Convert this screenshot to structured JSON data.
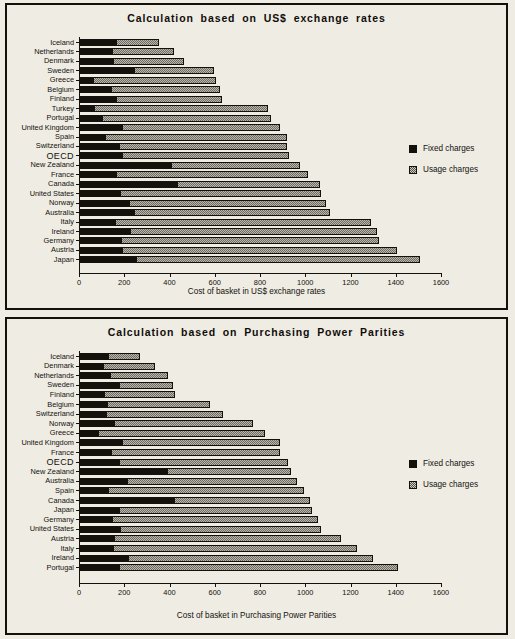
{
  "charts": [
    {
      "id": "usd",
      "title": "Calculation  based  on  US$  exchange  rates",
      "xlabel": "Cost of basket in US$ exchange rates",
      "legend": [
        {
          "key": "fixed",
          "label": "Fixed charges"
        },
        {
          "key": "usage",
          "label": "Usage charges"
        }
      ],
      "xticks": [
        "0",
        "200",
        "400",
        "600",
        "800",
        "1000",
        "1200",
        "1400",
        "1600"
      ],
      "chart_data": {
        "type": "bar",
        "orientation": "horizontal",
        "stacked": true,
        "title": "Calculation based on US$ exchange rates",
        "xlabel": "Cost of basket in US$ exchange rates",
        "ylabel": "",
        "xlim": [
          0,
          1600
        ],
        "xticks": [
          0,
          200,
          400,
          600,
          800,
          1000,
          1200,
          1400,
          1600
        ],
        "grid": false,
        "legend_position": "right",
        "categories": [
          "Iceland",
          "Netherlands",
          "Denmark",
          "Sweden",
          "Greece",
          "Belgium",
          "Finland",
          "Turkey",
          "Portugal",
          "United Kingdom",
          "Spain",
          "Switzerland",
          "OECD",
          "New Zealand",
          "France",
          "Canada",
          "United States",
          "Norway",
          "Australia",
          "Italy",
          "Ireland",
          "Germany",
          "Austria",
          "Japan"
        ],
        "series": [
          {
            "name": "Fixed charges",
            "values": [
              165,
              145,
              150,
              245,
              60,
              140,
              165,
              65,
              100,
              190,
              115,
              175,
              190,
              405,
              165,
              435,
              180,
              220,
              245,
              160,
              225,
              185,
              190,
              250
            ]
          },
          {
            "name": "Usage charges",
            "values": [
              190,
              275,
              315,
              350,
              545,
              485,
              465,
              770,
              750,
              700,
              805,
              745,
              740,
              570,
              845,
              630,
              890,
              870,
              865,
              1130,
              1090,
              1140,
              1215,
              1255
            ]
          }
        ],
        "totals": [
          355,
          420,
          465,
          595,
          605,
          625,
          630,
          835,
          850,
          890,
          920,
          920,
          930,
          975,
          1010,
          1065,
          1070,
          1090,
          1110,
          1290,
          1315,
          1325,
          1405,
          1505
        ]
      }
    },
    {
      "id": "ppp",
      "title": "Calculation  based  on  Purchasing  Power  Parities",
      "xlabel": "Cost of basket in Purchasing Power Parities",
      "legend": [
        {
          "key": "fixed",
          "label": "Fixed charges"
        },
        {
          "key": "usage",
          "label": "Usage charges"
        }
      ],
      "xticks": [
        "0",
        "200",
        "400",
        "600",
        "800",
        "1000",
        "1200",
        "1400",
        "1600"
      ],
      "chart_data": {
        "type": "bar",
        "orientation": "horizontal",
        "stacked": true,
        "title": "Calculation based on Purchasing Power Parities",
        "xlabel": "Cost of basket in Purchasing Power Parities",
        "ylabel": "",
        "xlim": [
          0,
          1600
        ],
        "xticks": [
          0,
          200,
          400,
          600,
          800,
          1000,
          1200,
          1400,
          1600
        ],
        "grid": false,
        "legend_position": "right",
        "categories": [
          "Iceland",
          "Denmark",
          "Netherlands",
          "Sweden",
          "Finland",
          "Belgium",
          "Switzerland",
          "Norway",
          "Greece",
          "United Kingdom",
          "France",
          "OECD",
          "New Zealand",
          "Australia",
          "Spain",
          "Canada",
          "Japan",
          "Germany",
          "United States",
          "Austria",
          "Italy",
          "Ireland",
          "Portugal"
        ],
        "series": [
          {
            "name": "Fixed charges",
            "values": [
              130,
              105,
              135,
              175,
              110,
              125,
              120,
              155,
              85,
              190,
              140,
              175,
              390,
              210,
              130,
              420,
              175,
              145,
              180,
              155,
              150,
              215,
              175
            ]
          },
          {
            "name": "Usage charges",
            "values": [
              140,
              230,
              260,
              240,
              315,
              455,
              515,
              615,
              735,
              700,
              750,
              750,
              545,
              755,
              865,
              600,
              855,
              910,
              890,
              1005,
              1080,
              1085,
              1235
            ]
          }
        ],
        "totals": [
          270,
          335,
          395,
          415,
          425,
          580,
          635,
          770,
          820,
          890,
          890,
          925,
          935,
          965,
          995,
          1020,
          1030,
          1055,
          1070,
          1160,
          1230,
          1300,
          1410
        ]
      }
    }
  ]
}
